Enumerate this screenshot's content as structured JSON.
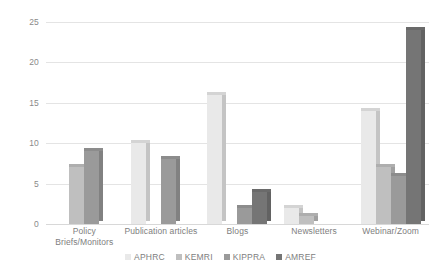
{
  "chart_data": {
    "type": "bar",
    "title": "",
    "subtitle": "",
    "xlabel": "",
    "ylabel": "",
    "ylim": [
      0,
      25
    ],
    "yticks": [
      0,
      5,
      10,
      15,
      20,
      25
    ],
    "grid": true,
    "legend_position": "bottom",
    "categories": [
      "Policy Briefs/Monitors",
      "Publication articles",
      "Blogs",
      "Newsletters",
      "Webinar/Zoom"
    ],
    "category_lines": [
      [
        "Policy",
        "Briefs/Monitors"
      ],
      [
        "Publication articles"
      ],
      [
        "Blogs"
      ],
      [
        "Newsletters"
      ],
      [
        "Webinar/Zoom"
      ]
    ],
    "series": [
      {
        "name": "APHRC",
        "color": "#e9e9e9",
        "values": [
          0,
          10,
          16,
          2,
          14
        ]
      },
      {
        "name": "KEMRI",
        "color": "#bfbfbf",
        "values": [
          7,
          0,
          0,
          1,
          7
        ]
      },
      {
        "name": "KIPPRA",
        "color": "#9a9a9a",
        "values": [
          9,
          8,
          2,
          0,
          6
        ]
      },
      {
        "name": "AMREF",
        "color": "#757575",
        "values": [
          0,
          0,
          4,
          0,
          24
        ]
      }
    ]
  },
  "legend": {
    "items": [
      {
        "label": "APHRC",
        "color": "#e9e9e9"
      },
      {
        "label": "KEMRI",
        "color": "#bfbfbf"
      },
      {
        "label": "KIPPRA",
        "color": "#9a9a9a"
      },
      {
        "label": "AMREF",
        "color": "#757575"
      }
    ]
  },
  "colors": {
    "background": "#ffffff",
    "gridline": "#e4e4e4",
    "axis_text": "#8a8a8a",
    "label_text": "#7e7e7e"
  }
}
